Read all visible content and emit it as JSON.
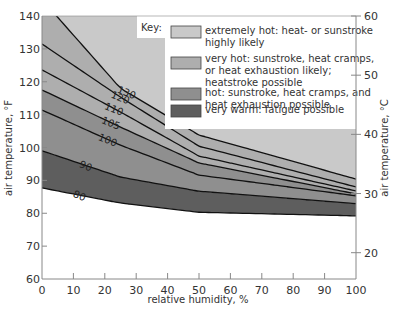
{
  "chart_data": {
    "type": "area",
    "title": "",
    "xlabel": "relative humidity, %",
    "ylabel": "air temperature, °F",
    "ylabel_right": "air temperature, °C",
    "xlim": [
      0,
      100
    ],
    "ylim": [
      60,
      140
    ],
    "ylim_right_celsius": [
      15.6,
      60
    ],
    "x_ticks": [
      "0",
      "10",
      "20",
      "30",
      "40",
      "50",
      "60",
      "70",
      "80",
      "90",
      "100"
    ],
    "y_ticks": [
      "60",
      "70",
      "80",
      "90",
      "100",
      "110",
      "120",
      "130",
      "140"
    ],
    "y_ticks_right": [
      "20",
      "30",
      "40",
      "50",
      "60"
    ],
    "grid": false,
    "x": [
      0,
      25,
      50,
      100
    ],
    "series": [
      {
        "name": "80",
        "values": [
          87.7,
          83.1,
          80.3,
          79.2
        ]
      },
      {
        "name": "90",
        "values": [
          99.0,
          91.0,
          86.7,
          82.9
        ]
      },
      {
        "name": "100",
        "values": [
          111.4,
          100.7,
          91.6,
          85.3
        ]
      },
      {
        "name": "105",
        "values": [
          117.5,
          106.2,
          95.3,
          85.9
        ]
      },
      {
        "name": "110",
        "values": [
          123.6,
          110.8,
          97.4,
          86.8
        ]
      },
      {
        "name": "120",
        "values": [
          131.5,
          115.3,
          100.4,
          88.0
        ]
      },
      {
        "name": "130",
        "values": [
          145.0,
          118.0,
          103.8,
          90.4
        ]
      }
    ],
    "legend": {
      "title": "Key:",
      "placement": "top-right",
      "entries": [
        {
          "label_lines": [
            "extremely hot: heat- or sunstroke",
            "highly likely"
          ],
          "color": "#c9c9c9"
        },
        {
          "label_lines": [
            "very hot: sunstroke, heat cramps,",
            "or heat exhaustion likely;",
            "heatstroke possible"
          ],
          "color": "#aeaeae"
        },
        {
          "label_lines": [
            "hot: sunstroke, heat cramps, and",
            "heat exhaustion possible"
          ],
          "color": "#8f8f8f"
        },
        {
          "label_lines": [
            "very warm: fatigue possible"
          ],
          "color": "#5e5e5e"
        }
      ]
    },
    "zones": [
      {
        "name": "extremely hot",
        "between": [
          "130",
          "top"
        ],
        "color": "#c9c9c9"
      },
      {
        "name": "very hot",
        "between": [
          "105",
          "130"
        ],
        "color": "#aeaeae"
      },
      {
        "name": "hot",
        "between": [
          "90",
          "105"
        ],
        "color": "#8f8f8f"
      },
      {
        "name": "very warm",
        "between": [
          "80",
          "90"
        ],
        "color": "#5e5e5e"
      }
    ]
  }
}
